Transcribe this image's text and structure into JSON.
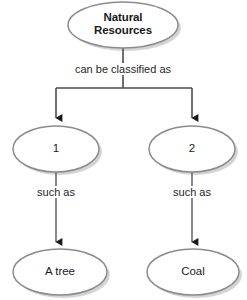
{
  "diagram": {
    "type": "concept-map",
    "canvas": {
      "width": 247,
      "height": 300
    },
    "colors": {
      "node_fill": "#ffffff",
      "node_stroke": "#8c8c8c",
      "node_shadow": "#c8c8c8",
      "connector": "#4d4d4d",
      "arrowhead": "#1a1a1a",
      "text": "#1a1a1a",
      "background": "#ffffff"
    },
    "nodes": [
      {
        "id": "root",
        "shape": "ellipse",
        "label": "Natural\nResources",
        "bold": true,
        "cx": 123,
        "cy": 25,
        "rx": 55,
        "ry": 23
      },
      {
        "id": "category-1",
        "shape": "ellipse",
        "label": "1",
        "bold": false,
        "cx": 56,
        "cy": 149,
        "rx": 43,
        "ry": 23
      },
      {
        "id": "category-2",
        "shape": "ellipse",
        "label": "2",
        "bold": false,
        "cx": 192,
        "cy": 149,
        "rx": 43,
        "ry": 23
      },
      {
        "id": "example-1",
        "shape": "ellipse",
        "label": "A tree",
        "bold": false,
        "cx": 60,
        "cy": 272,
        "rx": 47,
        "ry": 23
      },
      {
        "id": "example-2",
        "shape": "ellipse",
        "label": "Coal",
        "bold": false,
        "cx": 193,
        "cy": 272,
        "rx": 46,
        "ry": 23
      }
    ],
    "edge_labels": [
      {
        "id": "root-split",
        "text": "can be classified as",
        "x": 123,
        "y": 70
      },
      {
        "id": "such-as-left",
        "text": "such as",
        "x": 56,
        "y": 192
      },
      {
        "id": "such-as-right",
        "text": "such as",
        "x": 192,
        "y": 192
      }
    ],
    "connectors": [
      {
        "id": "root-to-branch",
        "from": "root",
        "to": "branch-bar",
        "arrow": false
      },
      {
        "id": "branch-to-category-1",
        "from": "branch-bar",
        "to": "category-1",
        "arrow": true
      },
      {
        "id": "branch-to-category-2",
        "from": "branch-bar",
        "to": "category-2",
        "arrow": true
      },
      {
        "id": "category-1-to-example-1",
        "from": "category-1",
        "to": "example-1",
        "arrow": true
      },
      {
        "id": "category-2-to-example-2",
        "from": "category-2",
        "to": "example-2",
        "arrow": true
      }
    ]
  }
}
